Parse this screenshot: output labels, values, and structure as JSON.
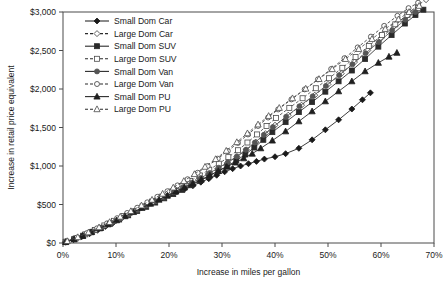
{
  "chart_data": {
    "type": "line",
    "title": "",
    "xlabel": "Increase in miles per gallon",
    "ylabel": "Increase in retail price equivalent",
    "xlim": [
      0,
      70
    ],
    "ylim": [
      0,
      3000
    ],
    "xticks": [
      "0%",
      "10%",
      "20%",
      "30%",
      "40%",
      "50%",
      "60%",
      "70%"
    ],
    "xtick_values": [
      0,
      10,
      20,
      30,
      40,
      50,
      60,
      70
    ],
    "yticks": [
      "$0",
      "$500",
      "$1,000",
      "$1,500",
      "$2,000",
      "$2,500",
      "$3,000"
    ],
    "ytick_values": [
      0,
      500,
      1000,
      1500,
      2000,
      2500,
      3000
    ],
    "grid": false,
    "legend_position": "top-center-inside",
    "series": [
      {
        "name": "Small Dom Car",
        "marker": "diamond",
        "filled": true,
        "dashed": false,
        "color": "#1a1a1a",
        "points": [
          [
            0.5,
            10
          ],
          [
            2.0,
            45
          ],
          [
            3.5,
            80
          ],
          [
            5.0,
            120
          ],
          [
            6.5,
            165
          ],
          [
            8.0,
            215
          ],
          [
            9.5,
            265
          ],
          [
            11.0,
            320
          ],
          [
            12.5,
            375
          ],
          [
            14.0,
            430
          ],
          [
            15.5,
            480
          ],
          [
            17.0,
            530
          ],
          [
            18.5,
            575
          ],
          [
            20.0,
            620
          ],
          [
            21.5,
            665
          ],
          [
            23.0,
            705
          ],
          [
            24.5,
            745
          ],
          [
            26.0,
            790
          ],
          [
            27.5,
            835
          ],
          [
            29.0,
            880
          ],
          [
            30.5,
            925
          ],
          [
            32.0,
            965
          ],
          [
            33.5,
            1000
          ],
          [
            35.0,
            1030
          ],
          [
            36.5,
            1060
          ],
          [
            38.0,
            1090
          ],
          [
            40.0,
            1120
          ],
          [
            42.0,
            1160
          ],
          [
            44.5,
            1230
          ],
          [
            47.0,
            1340
          ],
          [
            49.5,
            1470
          ],
          [
            52.0,
            1600
          ],
          [
            54.5,
            1740
          ],
          [
            56.5,
            1860
          ],
          [
            58.0,
            1950
          ]
        ]
      },
      {
        "name": "Large Dom Car",
        "marker": "diamond",
        "filled": false,
        "dashed": true,
        "color": "#3a3a3a",
        "points": [
          [
            0.5,
            15
          ],
          [
            2.2,
            55
          ],
          [
            4.0,
            105
          ],
          [
            5.8,
            160
          ],
          [
            7.6,
            215
          ],
          [
            9.4,
            275
          ],
          [
            11.2,
            335
          ],
          [
            13.0,
            395
          ],
          [
            14.8,
            455
          ],
          [
            16.6,
            515
          ],
          [
            18.4,
            575
          ],
          [
            20.2,
            635
          ],
          [
            22.0,
            695
          ],
          [
            23.8,
            760
          ],
          [
            25.6,
            825
          ],
          [
            27.4,
            895
          ],
          [
            29.2,
            965
          ],
          [
            31.0,
            1040
          ],
          [
            32.8,
            1120
          ],
          [
            34.6,
            1210
          ],
          [
            36.4,
            1310
          ],
          [
            38.2,
            1420
          ],
          [
            40.0,
            1530
          ],
          [
            42.5,
            1660
          ],
          [
            45.0,
            1790
          ],
          [
            47.5,
            1920
          ],
          [
            50.0,
            2060
          ],
          [
            52.5,
            2200
          ],
          [
            55.0,
            2350
          ],
          [
            57.5,
            2500
          ],
          [
            60.0,
            2660
          ],
          [
            62.5,
            2820
          ],
          [
            65.0,
            2970
          ],
          [
            67.0,
            3090
          ],
          [
            68.5,
            3160
          ]
        ]
      },
      {
        "name": "Small Dom SUV",
        "marker": "square",
        "filled": true,
        "dashed": false,
        "color": "#2a2a2a",
        "points": [
          [
            0.5,
            12
          ],
          [
            2.1,
            50
          ],
          [
            3.8,
            95
          ],
          [
            5.5,
            145
          ],
          [
            7.2,
            195
          ],
          [
            8.9,
            250
          ],
          [
            10.6,
            305
          ],
          [
            12.3,
            360
          ],
          [
            14.0,
            415
          ],
          [
            15.7,
            470
          ],
          [
            17.4,
            525
          ],
          [
            19.1,
            580
          ],
          [
            20.8,
            635
          ],
          [
            22.5,
            690
          ],
          [
            24.2,
            750
          ],
          [
            25.9,
            810
          ],
          [
            27.6,
            870
          ],
          [
            29.3,
            935
          ],
          [
            31.0,
            1000
          ],
          [
            32.7,
            1070
          ],
          [
            34.4,
            1150
          ],
          [
            36.1,
            1240
          ],
          [
            37.8,
            1340
          ],
          [
            39.5,
            1440
          ],
          [
            42.0,
            1570
          ],
          [
            44.5,
            1700
          ],
          [
            47.0,
            1830
          ],
          [
            49.5,
            1965
          ],
          [
            52.0,
            2100
          ],
          [
            54.5,
            2240
          ],
          [
            57.0,
            2390
          ],
          [
            59.5,
            2550
          ],
          [
            62.0,
            2700
          ],
          [
            64.5,
            2850
          ],
          [
            66.5,
            2960
          ],
          [
            68.0,
            3030
          ]
        ]
      },
      {
        "name": "Large Dom SUV",
        "marker": "square",
        "filled": false,
        "dashed": true,
        "color": "#4a4a4a",
        "points": [
          [
            0.6,
            18
          ],
          [
            2.4,
            60
          ],
          [
            4.2,
            112
          ],
          [
            6.0,
            168
          ],
          [
            7.8,
            228
          ],
          [
            9.6,
            288
          ],
          [
            11.4,
            350
          ],
          [
            13.2,
            412
          ],
          [
            15.0,
            475
          ],
          [
            16.8,
            538
          ],
          [
            18.6,
            602
          ],
          [
            20.4,
            668
          ],
          [
            22.2,
            735
          ],
          [
            24.0,
            805
          ],
          [
            25.8,
            878
          ],
          [
            27.6,
            952
          ],
          [
            29.4,
            1030
          ],
          [
            31.2,
            1115
          ],
          [
            33.0,
            1205
          ],
          [
            34.8,
            1305
          ],
          [
            36.6,
            1410
          ],
          [
            38.4,
            1520
          ],
          [
            40.2,
            1625
          ],
          [
            42.7,
            1755
          ],
          [
            45.2,
            1880
          ],
          [
            47.7,
            2010
          ],
          [
            50.2,
            2140
          ],
          [
            52.7,
            2275
          ],
          [
            55.2,
            2415
          ],
          [
            57.7,
            2560
          ],
          [
            60.2,
            2700
          ],
          [
            62.7,
            2840
          ],
          [
            65.0,
            2960
          ],
          [
            67.0,
            3050
          ]
        ]
      },
      {
        "name": "Small Dom Van",
        "marker": "circle",
        "filled": true,
        "dashed": false,
        "color": "#555555",
        "points": [
          [
            0.5,
            14
          ],
          [
            2.2,
            52
          ],
          [
            3.9,
            98
          ],
          [
            5.6,
            150
          ],
          [
            7.3,
            202
          ],
          [
            9.0,
            258
          ],
          [
            10.7,
            315
          ],
          [
            12.4,
            372
          ],
          [
            14.1,
            430
          ],
          [
            15.8,
            488
          ],
          [
            17.5,
            545
          ],
          [
            19.2,
            602
          ],
          [
            20.9,
            660
          ],
          [
            22.6,
            720
          ],
          [
            24.3,
            782
          ],
          [
            26.0,
            845
          ],
          [
            27.7,
            910
          ],
          [
            29.4,
            978
          ],
          [
            31.1,
            1048
          ],
          [
            32.8,
            1125
          ],
          [
            34.5,
            1210
          ],
          [
            36.2,
            1305
          ],
          [
            37.9,
            1405
          ],
          [
            39.6,
            1505
          ],
          [
            42.1,
            1640
          ],
          [
            44.6,
            1775
          ],
          [
            47.1,
            1905
          ],
          [
            49.6,
            2040
          ],
          [
            52.1,
            2180
          ],
          [
            54.6,
            2320
          ],
          [
            57.1,
            2465
          ],
          [
            59.6,
            2610
          ],
          [
            62.1,
            2760
          ],
          [
            64.6,
            2900
          ],
          [
            66.5,
            3000
          ]
        ]
      },
      {
        "name": "Large Dom Van",
        "marker": "circle",
        "filled": false,
        "dashed": true,
        "color": "#3a3a3a",
        "points": [
          [
            0.7,
            22
          ],
          [
            2.6,
            70
          ],
          [
            4.5,
            128
          ],
          [
            6.4,
            190
          ],
          [
            8.3,
            255
          ],
          [
            10.2,
            322
          ],
          [
            12.1,
            390
          ],
          [
            14.0,
            458
          ],
          [
            15.9,
            528
          ],
          [
            17.8,
            600
          ],
          [
            19.7,
            672
          ],
          [
            21.6,
            748
          ],
          [
            23.5,
            828
          ],
          [
            25.4,
            912
          ],
          [
            27.3,
            1000
          ],
          [
            29.2,
            1095
          ],
          [
            31.1,
            1195
          ],
          [
            33.0,
            1300
          ],
          [
            34.9,
            1410
          ],
          [
            36.8,
            1520
          ],
          [
            38.7,
            1630
          ],
          [
            40.6,
            1735
          ],
          [
            43.1,
            1865
          ],
          [
            45.6,
            1995
          ],
          [
            48.1,
            2125
          ],
          [
            50.6,
            2260
          ],
          [
            53.1,
            2400
          ],
          [
            55.6,
            2540
          ],
          [
            58.1,
            2680
          ],
          [
            60.6,
            2820
          ],
          [
            63.1,
            2950
          ],
          [
            65.2,
            3050
          ],
          [
            67.0,
            3120
          ]
        ]
      },
      {
        "name": "Small Dom PU",
        "marker": "triangle",
        "filled": true,
        "dashed": false,
        "color": "#1f1f1f",
        "points": [
          [
            0.5,
            12
          ],
          [
            2.1,
            48
          ],
          [
            3.7,
            92
          ],
          [
            5.3,
            140
          ],
          [
            6.9,
            190
          ],
          [
            8.5,
            242
          ],
          [
            10.1,
            295
          ],
          [
            11.7,
            348
          ],
          [
            13.3,
            402
          ],
          [
            14.9,
            456
          ],
          [
            16.5,
            510
          ],
          [
            18.1,
            562
          ],
          [
            19.7,
            615
          ],
          [
            21.3,
            668
          ],
          [
            22.9,
            720
          ],
          [
            24.5,
            772
          ],
          [
            26.1,
            825
          ],
          [
            27.7,
            880
          ],
          [
            29.3,
            935
          ],
          [
            30.9,
            990
          ],
          [
            32.5,
            1045
          ],
          [
            34.1,
            1100
          ],
          [
            35.7,
            1160
          ],
          [
            37.3,
            1230
          ],
          [
            39.5,
            1330
          ],
          [
            42.0,
            1450
          ],
          [
            44.5,
            1580
          ],
          [
            47.0,
            1710
          ],
          [
            49.5,
            1840
          ],
          [
            52.0,
            1970
          ],
          [
            54.5,
            2100
          ],
          [
            57.0,
            2230
          ],
          [
            59.5,
            2340
          ],
          [
            61.5,
            2420
          ],
          [
            63.0,
            2470
          ]
        ]
      },
      {
        "name": "Large Dom PU",
        "marker": "triangle",
        "filled": false,
        "dashed": true,
        "color": "#4a4a4a",
        "points": [
          [
            0.8,
            25
          ],
          [
            2.8,
            76
          ],
          [
            4.8,
            138
          ],
          [
            6.8,
            204
          ],
          [
            8.8,
            272
          ],
          [
            10.8,
            342
          ],
          [
            12.8,
            414
          ],
          [
            14.8,
            488
          ],
          [
            16.8,
            562
          ],
          [
            18.8,
            640
          ],
          [
            20.8,
            720
          ],
          [
            22.8,
            805
          ],
          [
            24.8,
            895
          ],
          [
            26.8,
            990
          ],
          [
            28.8,
            1090
          ],
          [
            30.8,
            1198
          ],
          [
            32.8,
            1310
          ],
          [
            34.8,
            1425
          ],
          [
            36.8,
            1540
          ],
          [
            38.8,
            1650
          ],
          [
            40.8,
            1755
          ],
          [
            43.3,
            1880
          ],
          [
            45.8,
            2005
          ],
          [
            48.3,
            2130
          ],
          [
            50.8,
            2258
          ],
          [
            53.3,
            2390
          ],
          [
            55.8,
            2520
          ],
          [
            58.3,
            2650
          ],
          [
            60.8,
            2780
          ],
          [
            63.3,
            2905
          ],
          [
            65.3,
            3000
          ],
          [
            67.2,
            3080
          ]
        ]
      }
    ]
  }
}
